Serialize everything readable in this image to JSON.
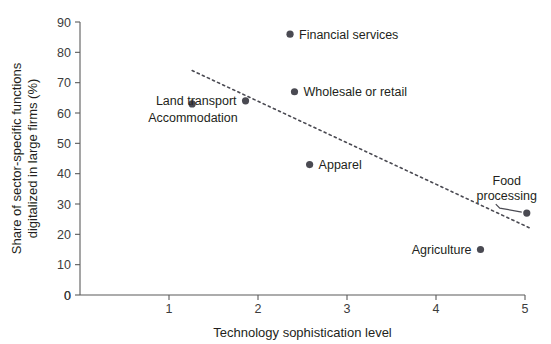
{
  "chart_data": {
    "type": "scatter",
    "title": "",
    "xlabel": "Technology sophistication level",
    "ylabel": "Share of sector-specific functions digitalized in large firms (%)",
    "ylabel_line1": "Share of sector-specific functions",
    "ylabel_line2": "digitalized in large firms (%)",
    "xlim": [
      0,
      5
    ],
    "ylim": [
      0,
      90
    ],
    "xticks": [
      "0",
      "1",
      "2",
      "3",
      "4",
      "5"
    ],
    "xtick_values": [
      0,
      1,
      2,
      3,
      4,
      5
    ],
    "yticks": [
      "0",
      "10",
      "20",
      "30",
      "40",
      "50",
      "60",
      "70",
      "80",
      "90"
    ],
    "ytick_values": [
      0,
      10,
      20,
      30,
      40,
      50,
      60,
      70,
      80,
      90
    ],
    "grid": false,
    "legend": "none",
    "marker_color": "#4a4a52",
    "points": [
      {
        "name": "Financial services",
        "x": 2.36,
        "y": 86,
        "label_side": "right"
      },
      {
        "name": "Wholesale or retail",
        "x": 2.41,
        "y": 67,
        "label_side": "right"
      },
      {
        "name": "Land transport",
        "x": 1.86,
        "y": 64,
        "label_side": "left"
      },
      {
        "name": "Accommodation",
        "x": 1.26,
        "y": 63,
        "label_side": "below"
      },
      {
        "name": "Apparel",
        "x": 2.58,
        "y": 43,
        "label_side": "right"
      },
      {
        "name": "Agriculture",
        "x": 4.5,
        "y": 15,
        "label_side": "left"
      },
      {
        "name": "Food processing",
        "x": 5.02,
        "y": 27,
        "label_side": "leader"
      }
    ],
    "trendline": {
      "style": "dotted",
      "x_start": 1.26,
      "y_start": 74,
      "x_end": 5.06,
      "y_end": 22
    },
    "annotations": []
  }
}
